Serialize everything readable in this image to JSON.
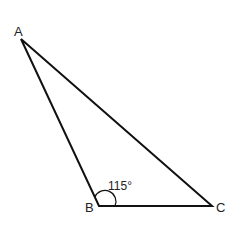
{
  "diagram": {
    "type": "triangle",
    "vertices": [
      {
        "label": "A",
        "x": 21,
        "y": 39
      },
      {
        "label": "B",
        "x": 99,
        "y": 206
      },
      {
        "label": "C",
        "x": 212,
        "y": 206
      }
    ],
    "angle_mark": {
      "vertex": "B",
      "value": "115°"
    },
    "colors": {
      "stroke": "#111111",
      "text": "#222222",
      "background": "#ffffff"
    }
  }
}
